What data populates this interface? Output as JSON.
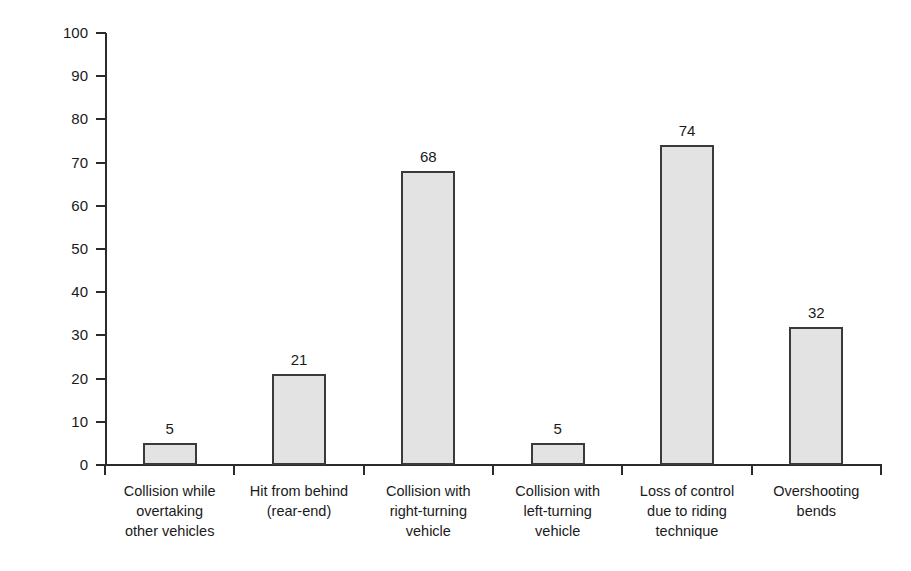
{
  "chart_data": {
    "type": "bar",
    "title": "",
    "xlabel": "",
    "ylabel": "Number of respondents (%)",
    "ylim": [
      0,
      100
    ],
    "ytick_values": [
      100,
      90,
      80,
      70,
      60,
      50,
      40,
      30,
      20,
      10,
      0
    ],
    "ytick_labels": [
      "100",
      "90",
      "80",
      "70",
      "60",
      "50",
      "40",
      "30",
      "20",
      "10",
      "0"
    ],
    "grid": false,
    "legend": false,
    "categories": [
      "Collision while overtaking other vehicles",
      "Hit from behind (rear-end)",
      "Collision with right-turning vehicle",
      "Collision with left-turning vehicle",
      "Loss of control due to riding technique",
      "Overshooting bends"
    ],
    "category_label_lines": [
      [
        "Collision while",
        "overtaking",
        "other vehicles"
      ],
      [
        "Hit from behind",
        "(rear-end)"
      ],
      [
        "Collision with",
        "right-turning",
        "vehicle"
      ],
      [
        "Collision with",
        "left-turning",
        "vehicle"
      ],
      [
        "Loss of control",
        "due to riding",
        "technique"
      ],
      [
        "Overshooting",
        "bends"
      ]
    ],
    "values": [
      5,
      21,
      68,
      5,
      74,
      32
    ],
    "data_labels": [
      "5",
      "21",
      "68",
      "5",
      "74",
      "32"
    ],
    "colors": {
      "bar_fill": "#e3e3e3",
      "bar_border": "#3a3a3a",
      "axis": "#2b2b2b",
      "text": "#1a1a1a",
      "background": "#ffffff"
    }
  }
}
